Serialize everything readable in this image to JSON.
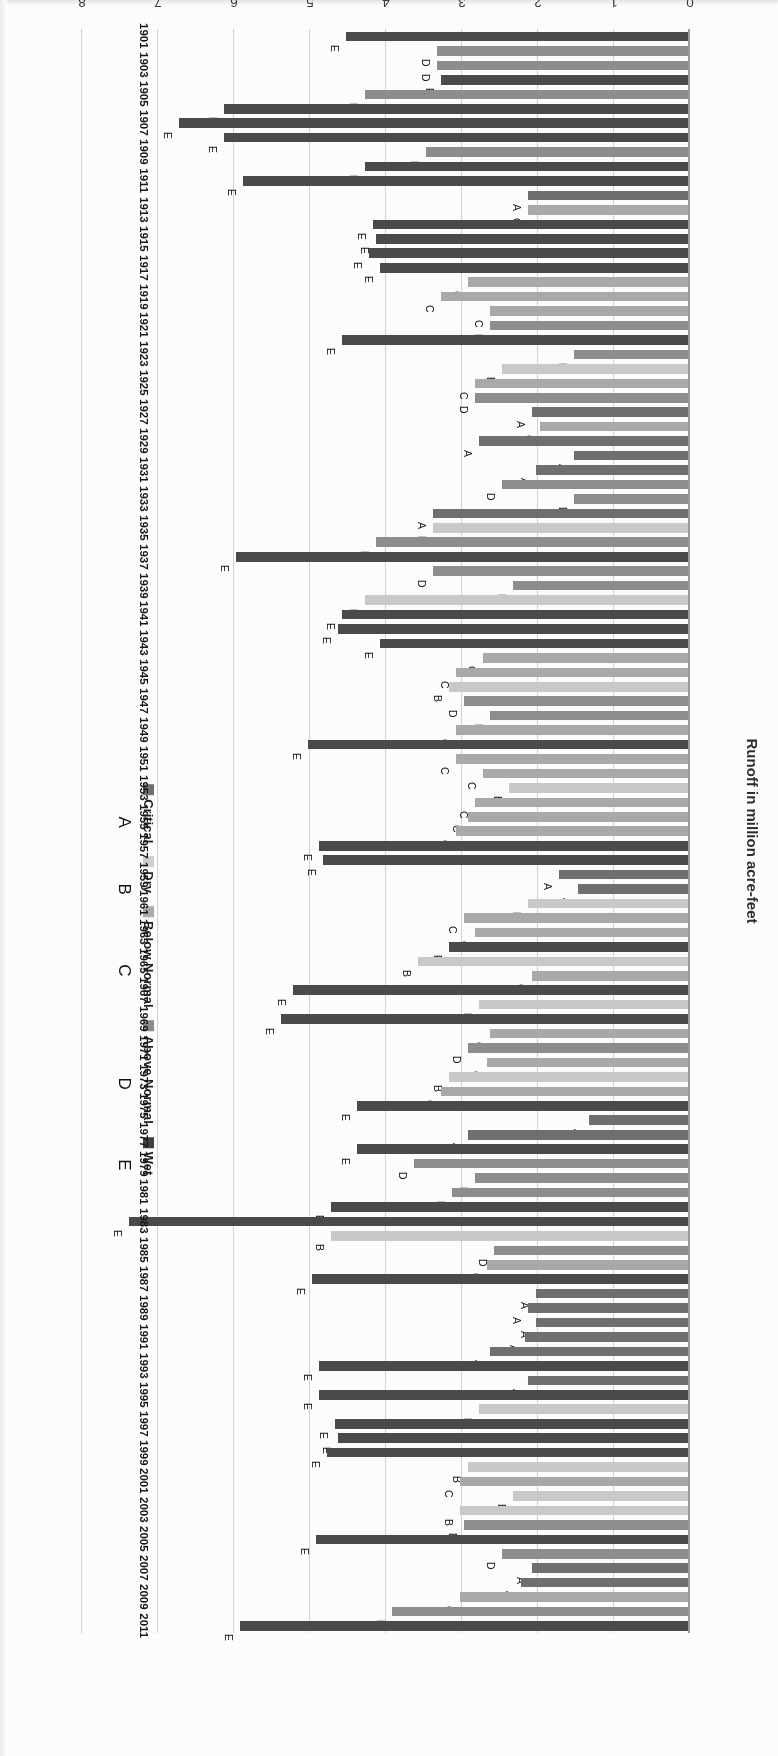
{
  "chart_data": {
    "type": "bar",
    "orientation": "horizontal",
    "title": "",
    "xlabel": "",
    "ylabel": "Runoff in million acre-feet",
    "value_axis_label": "Runoff in million acre-feet",
    "value_ticks": [
      "0",
      "1",
      "2",
      "3",
      "4",
      "5",
      "6",
      "7",
      "8"
    ],
    "ylim": [
      0,
      8
    ],
    "grid": true,
    "legend_position": "top-left",
    "legend": [
      {
        "code": "A",
        "label": "Critical",
        "color": "#6f6f6f"
      },
      {
        "code": "B",
        "label": "Dry",
        "color": "#cfcfcf"
      },
      {
        "code": "C",
        "label": "Below Normal",
        "color": "#ababab"
      },
      {
        "code": "D",
        "label": "Above Normal",
        "color": "#8d8d8d"
      },
      {
        "code": "E",
        "label": "Wet",
        "color": "#3f3f3f"
      }
    ],
    "category_axis_tick_labels": [
      "1901",
      "1903",
      "1905",
      "1907",
      "1909",
      "1911",
      "1913",
      "1915",
      "1917",
      "1919",
      "1921",
      "1923",
      "1925",
      "1927",
      "1929",
      "1931",
      "1933",
      "1935",
      "1937",
      "1939",
      "1941",
      "1943",
      "1945",
      "1947",
      "1949",
      "1951",
      "1953",
      "1955",
      "1957",
      "1959",
      "1961",
      "1963",
      "1965",
      "1967",
      "1969",
      "1971",
      "1973",
      "1975",
      "1977",
      "1979",
      "1981",
      "1983",
      "1985",
      "1987",
      "1989",
      "1991",
      "1993",
      "1995",
      "1997",
      "1999",
      "2001",
      "2003",
      "2005",
      "2007",
      "2009",
      "2011"
    ],
    "categories": [
      "1901",
      "1902",
      "1903",
      "1904",
      "1905",
      "1906",
      "1907",
      "1908",
      "1909",
      "1910",
      "1911",
      "1912",
      "1913",
      "1914",
      "1915",
      "1916",
      "1917",
      "1918",
      "1919",
      "1920",
      "1921",
      "1922",
      "1923",
      "1924",
      "1925",
      "1926",
      "1927",
      "1928",
      "1929",
      "1930",
      "1931",
      "1932",
      "1933",
      "1934",
      "1935",
      "1936",
      "1937",
      "1938",
      "1939",
      "1940",
      "1941",
      "1942",
      "1943",
      "1944",
      "1945",
      "1946",
      "1947",
      "1948",
      "1949",
      "1950",
      "1951",
      "1952",
      "1953",
      "1954",
      "1955",
      "1956",
      "1957",
      "1958",
      "1959",
      "1960",
      "1961",
      "1962",
      "1963",
      "1964",
      "1965",
      "1966",
      "1967",
      "1968",
      "1969",
      "1970",
      "1971",
      "1972",
      "1973",
      "1974",
      "1975",
      "1976",
      "1977",
      "1978",
      "1979",
      "1980",
      "1981",
      "1982",
      "1983",
      "1984",
      "1985",
      "1986",
      "1987",
      "1988",
      "1989",
      "1990",
      "1991",
      "1992",
      "1993",
      "1994",
      "1995",
      "1996",
      "1997",
      "1998",
      "1999",
      "2000",
      "2001",
      "2002",
      "2003",
      "2004",
      "2005",
      "2006",
      "2007",
      "2008",
      "2009",
      "2010",
      "2011"
    ],
    "values": [
      4.5,
      3.3,
      3.3,
      3.25,
      4.25,
      6.1,
      6.7,
      6.1,
      3.45,
      4.25,
      5.85,
      2.1,
      2.1,
      4.15,
      4.1,
      4.2,
      4.05,
      2.9,
      3.25,
      2.6,
      2.6,
      4.55,
      1.5,
      2.45,
      2.8,
      2.8,
      2.05,
      1.95,
      2.75,
      1.5,
      2.0,
      2.45,
      1.5,
      3.35,
      3.35,
      4.1,
      5.95,
      3.35,
      2.3,
      4.25,
      4.55,
      4.6,
      4.05,
      2.7,
      3.05,
      3.15,
      2.95,
      2.6,
      3.05,
      5.0,
      3.05,
      2.7,
      2.35,
      2.8,
      2.9,
      3.05,
      4.85,
      4.8,
      1.7,
      1.45,
      2.1,
      2.95,
      2.8,
      3.15,
      3.55,
      2.05,
      5.2,
      2.75,
      5.35,
      2.6,
      2.9,
      2.65,
      3.15,
      3.25,
      4.35,
      1.3,
      2.9,
      4.35,
      3.6,
      2.8,
      3.1,
      4.7,
      7.35,
      4.7,
      2.55,
      2.65,
      4.95,
      2.0,
      2.1,
      2.0,
      2.15,
      2.6,
      4.85,
      2.1,
      4.85,
      2.75,
      4.65,
      4.6,
      4.75,
      2.9,
      3.0,
      2.3,
      3.0,
      2.95,
      4.9,
      2.45,
      2.05,
      2.2,
      3.0,
      3.9,
      5.9
    ],
    "classes": [
      "E",
      "D",
      "D",
      "E",
      "D",
      "E",
      "E",
      "E",
      "D",
      "E",
      "E",
      "A",
      "C",
      "E",
      "E",
      "E",
      "E",
      "C",
      "C",
      "C",
      "D",
      "E",
      "D",
      "B",
      "C",
      "D",
      "A",
      "C",
      "A",
      "A",
      "A",
      "D",
      "D",
      "A",
      "B",
      "D",
      "E",
      "D",
      "D",
      "B",
      "E",
      "E",
      "E",
      "C",
      "C",
      "B",
      "D",
      "D",
      "C",
      "E",
      "C",
      "C",
      "B",
      "C",
      "C",
      "C",
      "E",
      "E",
      "A",
      "A",
      "B",
      "C",
      "C",
      "E",
      "B",
      "C",
      "E",
      "B",
      "E",
      "C",
      "D",
      "C",
      "B",
      "C",
      "E",
      "A",
      "A",
      "E",
      "D",
      "D",
      "D",
      "E",
      "E",
      "B",
      "D",
      "C",
      "E",
      "A",
      "A",
      "A",
      "A",
      "A",
      "E",
      "A",
      "E",
      "B",
      "E",
      "E",
      "E",
      "B",
      "C",
      "B",
      "B",
      "D",
      "E",
      "D",
      "A",
      "A",
      "C",
      "D",
      "E"
    ],
    "labeled_classes_visible": [
      "E",
      "D",
      "D",
      "E",
      "D",
      "E",
      "E",
      "E",
      "D",
      "E",
      "E",
      "A",
      "C",
      "E",
      "E",
      "E",
      "E",
      "C",
      "C",
      "C",
      "D",
      "E",
      "D",
      "B",
      "C",
      "D",
      "A",
      "C",
      "A",
      "A",
      "A",
      "D",
      "D",
      "A",
      "B",
      "D",
      "E",
      "D",
      "D",
      "B",
      "E",
      "E",
      "E",
      "C",
      "C",
      "B",
      "D",
      "D",
      "C",
      "E",
      "C",
      "C",
      "B",
      "C",
      "C",
      "C",
      "E",
      "E",
      "A",
      "A",
      "B",
      "C",
      "C",
      "E",
      "B",
      "C",
      "E",
      "B",
      "E",
      "C",
      "D",
      "C",
      "B",
      "C",
      "E",
      "A",
      "A",
      "E",
      "D",
      "D",
      "D",
      "E",
      "E",
      "B",
      "D",
      "C",
      "E",
      "A",
      "A",
      "A",
      "A",
      "A",
      "E",
      "A",
      "E",
      "B",
      "E",
      "E",
      "E",
      "B",
      "C",
      "B",
      "B",
      "D",
      "E",
      "D",
      "A",
      "A",
      "C",
      "D",
      "E"
    ]
  },
  "axis": {
    "value_title": "Runoff in million acre-feet"
  }
}
